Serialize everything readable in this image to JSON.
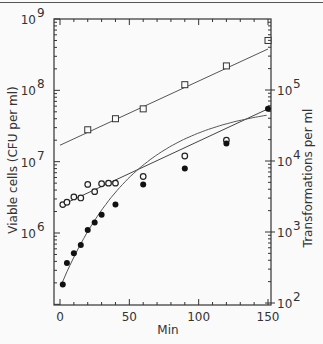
{
  "chart_data": {
    "type": "scatter",
    "title": "",
    "xlabel": "Min",
    "ylabel_left": "Viable cells (CFU per ml)",
    "ylabel_right": "Transformations per ml",
    "xlim": [
      0,
      150
    ],
    "ylim_left": [
      100000,
      1000000000
    ],
    "ylim_right": [
      100,
      300000
    ],
    "yscale": "log",
    "grid": false,
    "x_ticks": [
      "0",
      "50",
      "100",
      "150"
    ],
    "y_ticks_left": [
      {
        "base": "10",
        "exp": "9"
      },
      {
        "base": "10",
        "exp": "8"
      },
      {
        "base": "10",
        "exp": "7"
      },
      {
        "base": "10",
        "exp": "6"
      }
    ],
    "y_ticks_right": [
      {
        "base": "10",
        "exp": "5"
      },
      {
        "base": "10",
        "exp": "4"
      },
      {
        "base": "10",
        "exp": "3"
      },
      {
        "base": "10",
        "exp": "2"
      }
    ],
    "series": [
      {
        "name": "Viable cells (open squares)",
        "marker": "open-square",
        "axis": "left",
        "x": [
          20,
          40,
          60,
          90,
          120,
          150
        ],
        "y": [
          28000000,
          40000000,
          55000000,
          120000000,
          220000000,
          500000000
        ]
      },
      {
        "name": "Transformations (open circles)",
        "marker": "open-circle",
        "axis": "left",
        "x": [
          2,
          5,
          10,
          15,
          20,
          25,
          30,
          35,
          40,
          60,
          90,
          120
        ],
        "y": [
          2500000,
          2700000,
          3200000,
          3100000,
          4800000,
          3800000,
          4900000,
          5000000,
          5000000,
          6200000,
          12000000,
          20000000
        ]
      },
      {
        "name": "Transformations (filled circles)",
        "marker": "filled-circle",
        "axis": "left",
        "x": [
          2,
          5,
          10,
          15,
          20,
          25,
          30,
          40,
          60,
          90,
          120,
          150
        ],
        "y": [
          190000,
          380000,
          520000,
          680000,
          1100000,
          1400000,
          1800000,
          2500000,
          4800000,
          8000000,
          18000000,
          55000000
        ]
      }
    ]
  }
}
